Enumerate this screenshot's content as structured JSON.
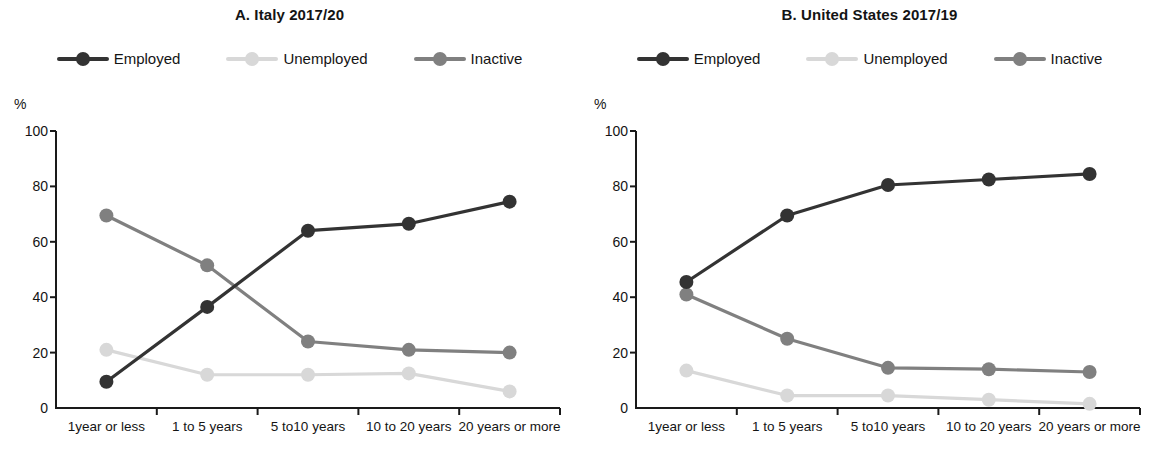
{
  "figure": {
    "axis_unit": "%",
    "y_ticks": [
      0,
      20,
      40,
      60,
      80,
      100
    ],
    "categories": [
      "1year or less",
      "1 to 5 years",
      "5 to10 years",
      "10 to 20 years",
      "20 years or more"
    ],
    "series_names": [
      "Employed",
      "Unemployed",
      "Inactive"
    ],
    "colors": {
      "employed": "#333333",
      "unemployed": "#d8d8d8",
      "inactive": "#808080",
      "axis": "#1a1a1a",
      "background": "#ffffff"
    }
  },
  "panels": [
    {
      "id": "panel-a",
      "title": "A. Italy 2017/20",
      "legend": [
        {
          "label": "Employed",
          "color_key": "employed",
          "marker": "line-dot-marker"
        },
        {
          "label": "Unemployed",
          "color_key": "unemployed",
          "marker": "line-dot-marker"
        },
        {
          "label": "Inactive",
          "color_key": "inactive",
          "marker": "line-dot-marker"
        }
      ]
    },
    {
      "id": "panel-b",
      "title": "B. United States 2017/19",
      "legend": [
        {
          "label": "Employed",
          "color_key": "employed",
          "marker": "line-dot-marker"
        },
        {
          "label": "Unemployed",
          "color_key": "unemployed",
          "marker": "line-dot-marker"
        },
        {
          "label": "Inactive",
          "color_key": "inactive",
          "marker": "line-dot-marker"
        }
      ]
    }
  ],
  "chart_data": [
    {
      "type": "line",
      "panel": "A",
      "title": "A. Italy 2017/20",
      "xlabel": "",
      "ylabel": "%",
      "ylim": [
        0,
        100
      ],
      "yticks": [
        0,
        20,
        40,
        60,
        80,
        100
      ],
      "grid": false,
      "legend_position": "top-center",
      "categories": [
        "1year or less",
        "1 to 5 years",
        "5 to10 years",
        "10 to 20 years",
        "20 years or more"
      ],
      "series": [
        {
          "name": "Employed",
          "color": "#333333",
          "values": [
            9.5,
            36.5,
            64.0,
            66.5,
            74.5
          ]
        },
        {
          "name": "Unemployed",
          "color": "#d8d8d8",
          "values": [
            21.0,
            12.0,
            12.0,
            12.5,
            6.0
          ]
        },
        {
          "name": "Inactive",
          "color": "#808080",
          "values": [
            69.5,
            51.5,
            24.0,
            21.0,
            20.0
          ]
        }
      ]
    },
    {
      "type": "line",
      "panel": "B",
      "title": "B. United States 2017/19",
      "xlabel": "",
      "ylabel": "%",
      "ylim": [
        0,
        100
      ],
      "yticks": [
        0,
        20,
        40,
        60,
        80,
        100
      ],
      "grid": false,
      "legend_position": "top-center",
      "categories": [
        "1year or less",
        "1 to 5 years",
        "5 to10 years",
        "10 to 20 years",
        "20 years or more"
      ],
      "series": [
        {
          "name": "Employed",
          "color": "#333333",
          "values": [
            45.5,
            69.5,
            80.5,
            82.5,
            84.5
          ]
        },
        {
          "name": "Unemployed",
          "color": "#d8d8d8",
          "values": [
            13.5,
            4.5,
            4.5,
            3.0,
            1.5
          ]
        },
        {
          "name": "Inactive",
          "color": "#808080",
          "values": [
            41.0,
            25.0,
            14.5,
            14.0,
            13.0
          ]
        }
      ]
    }
  ]
}
